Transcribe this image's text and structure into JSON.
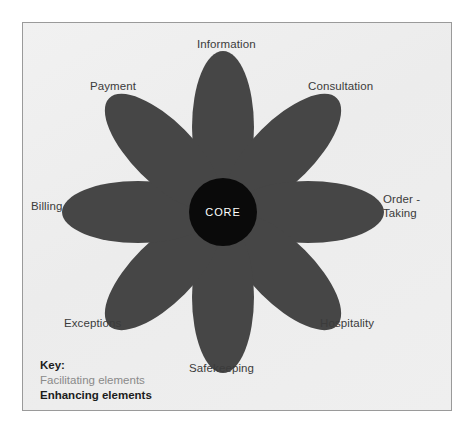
{
  "diagram": {
    "core_label": "CORE",
    "petal_color": "#464646",
    "core_color": "#0a0a0a",
    "core_text_color": "#ffffff",
    "background_color": "#eeeeee",
    "border_color": "#9a9a9a",
    "label_color": "#3b3b3b",
    "petals": [
      {
        "id": "information",
        "label": "Information",
        "angle_deg": 0,
        "category": "facilitating"
      },
      {
        "id": "consultation",
        "label": "Consultation",
        "angle_deg": 45,
        "category": "enhancing"
      },
      {
        "id": "order-taking",
        "label": "Order -\nTaking",
        "label_line1": "Order -",
        "label_line2": "Taking",
        "angle_deg": 90,
        "category": "facilitating"
      },
      {
        "id": "hospitality",
        "label": "Hospitality",
        "angle_deg": 135,
        "category": "enhancing"
      },
      {
        "id": "safekeeping",
        "label": "Safekeeping",
        "angle_deg": 180,
        "category": "enhancing"
      },
      {
        "id": "exceptions",
        "label": "Exceptions",
        "angle_deg": 225,
        "category": "enhancing"
      },
      {
        "id": "billing",
        "label": "Billing",
        "angle_deg": 270,
        "category": "facilitating"
      },
      {
        "id": "payment",
        "label": "Payment",
        "angle_deg": 315,
        "category": "facilitating"
      }
    ]
  },
  "key": {
    "title": "Key:",
    "facilitating": "Facilitating elements",
    "enhancing": "Enhancing elements",
    "facilitating_color": "#8a8a8a",
    "enhancing_color": "#1c1c1c"
  }
}
